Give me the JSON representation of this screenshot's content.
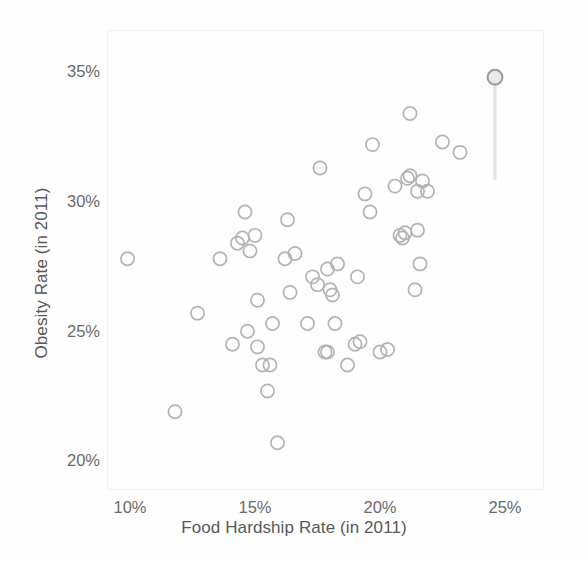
{
  "chart_data": {
    "type": "scatter",
    "title": "",
    "xlabel": "Food Hardship Rate (in 2011)",
    "ylabel": "Obesity Rate (in 2011)",
    "xlim": [
      9.0,
      26.5
    ],
    "ylim": [
      19.2,
      35.8
    ],
    "xticks": [
      10,
      15,
      20,
      25
    ],
    "xticklabels": [
      "10%",
      "15%",
      "20%",
      "25%"
    ],
    "yticks": [
      20,
      25,
      30,
      35
    ],
    "yticklabels": [
      "20%",
      "25%",
      "30%",
      "35%"
    ],
    "grid": false,
    "legend": null,
    "marker": "open-circle",
    "marker_color": "#b3b3b3",
    "highlight_color": "#9a9a9a",
    "points": [
      {
        "x": 9.9,
        "y": 27.8
      },
      {
        "x": 11.8,
        "y": 21.9
      },
      {
        "x": 12.7,
        "y": 25.7
      },
      {
        "x": 13.6,
        "y": 27.8
      },
      {
        "x": 14.1,
        "y": 24.5
      },
      {
        "x": 14.3,
        "y": 28.4
      },
      {
        "x": 14.5,
        "y": 28.6
      },
      {
        "x": 14.6,
        "y": 29.6
      },
      {
        "x": 14.7,
        "y": 25.0
      },
      {
        "x": 14.8,
        "y": 28.1
      },
      {
        "x": 15.0,
        "y": 28.7
      },
      {
        "x": 15.1,
        "y": 26.2
      },
      {
        "x": 15.1,
        "y": 24.4
      },
      {
        "x": 15.3,
        "y": 23.7
      },
      {
        "x": 15.5,
        "y": 22.7
      },
      {
        "x": 15.6,
        "y": 23.7
      },
      {
        "x": 15.7,
        "y": 25.3
      },
      {
        "x": 15.9,
        "y": 20.7
      },
      {
        "x": 16.2,
        "y": 27.8
      },
      {
        "x": 16.3,
        "y": 29.3
      },
      {
        "x": 16.4,
        "y": 26.5
      },
      {
        "x": 16.6,
        "y": 28.0
      },
      {
        "x": 17.1,
        "y": 25.3
      },
      {
        "x": 17.3,
        "y": 27.1
      },
      {
        "x": 17.5,
        "y": 26.8
      },
      {
        "x": 17.6,
        "y": 31.3
      },
      {
        "x": 17.8,
        "y": 24.2
      },
      {
        "x": 17.9,
        "y": 24.2
      },
      {
        "x": 17.9,
        "y": 27.4
      },
      {
        "x": 18.0,
        "y": 26.6
      },
      {
        "x": 18.1,
        "y": 26.4
      },
      {
        "x": 18.2,
        "y": 25.3
      },
      {
        "x": 18.3,
        "y": 27.6
      },
      {
        "x": 18.7,
        "y": 23.7
      },
      {
        "x": 19.0,
        "y": 24.5
      },
      {
        "x": 19.2,
        "y": 24.6
      },
      {
        "x": 19.1,
        "y": 27.1
      },
      {
        "x": 19.4,
        "y": 30.3
      },
      {
        "x": 19.6,
        "y": 29.6
      },
      {
        "x": 19.7,
        "y": 32.2
      },
      {
        "x": 20.0,
        "y": 24.2
      },
      {
        "x": 20.3,
        "y": 24.3
      },
      {
        "x": 20.6,
        "y": 30.6
      },
      {
        "x": 20.8,
        "y": 28.7
      },
      {
        "x": 20.9,
        "y": 28.6
      },
      {
        "x": 21.0,
        "y": 28.8
      },
      {
        "x": 21.1,
        "y": 30.9
      },
      {
        "x": 21.2,
        "y": 31.0
      },
      {
        "x": 21.2,
        "y": 33.4
      },
      {
        "x": 21.4,
        "y": 26.6
      },
      {
        "x": 21.5,
        "y": 28.9
      },
      {
        "x": 21.5,
        "y": 30.4
      },
      {
        "x": 21.6,
        "y": 27.6
      },
      {
        "x": 21.7,
        "y": 30.8
      },
      {
        "x": 21.9,
        "y": 30.4
      },
      {
        "x": 22.5,
        "y": 32.3
      },
      {
        "x": 23.2,
        "y": 31.9
      },
      {
        "x": 24.6,
        "y": 34.8,
        "highlight": true,
        "stem_to": 30.9
      }
    ]
  }
}
